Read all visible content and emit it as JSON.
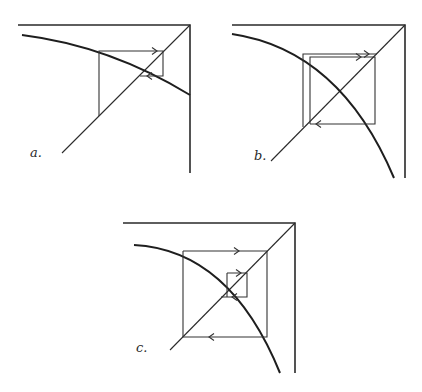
{
  "figure": {
    "panels": [
      {
        "label": "a.",
        "behavior": "converging"
      },
      {
        "label": "b.",
        "behavior": "diverging to two-cycle"
      },
      {
        "label": "c.",
        "behavior": "converging to two-cycle from both sides"
      }
    ]
  },
  "colors": {
    "ink": "#2a2a2a",
    "background": "#ffffff"
  }
}
